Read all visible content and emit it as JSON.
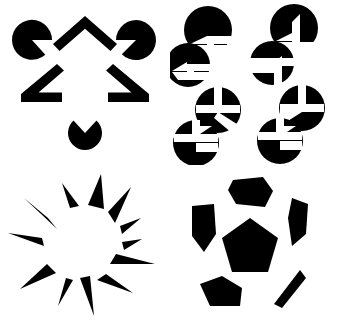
{
  "figure": {
    "background_color": "#ffffff",
    "ink_color": "#000000",
    "width": 337,
    "height": 323,
    "panel_count": 4
  },
  "panels": [
    {
      "id": "kanizsa-triangle",
      "label": "Kanizsa Triangle",
      "position": "top-left",
      "inducer_count": 7,
      "illusory_shape": "triangle",
      "inducers": [
        {
          "name": "pacman-top-left",
          "type": "pacman",
          "cx": 32,
          "cy": 40,
          "r": 20,
          "notch_deg": 75,
          "opening_deg": 40,
          "label": "notched disk opening lower-right"
        },
        {
          "name": "pacman-top-right",
          "type": "pacman",
          "cx": 136,
          "cy": 40,
          "r": 20,
          "notch_deg": 65,
          "opening_deg": 140,
          "label": "notched disk opening lower-left"
        },
        {
          "name": "pacman-bottom",
          "type": "pacman",
          "cx": 85,
          "cy": 133,
          "r": 17,
          "notch_deg": 60,
          "opening_deg": 270,
          "label": "notched disk opening upward"
        },
        {
          "name": "chevron-top",
          "type": "angle",
          "label": "open angle pointing up"
        },
        {
          "name": "angle-bottom-left",
          "type": "angle",
          "label": "open angle opening right"
        },
        {
          "name": "angle-bottom-right",
          "type": "angle",
          "label": "open angle opening left"
        }
      ]
    },
    {
      "id": "illusory-cubes",
      "label": "Illusory Cubes Array",
      "position": "top-right",
      "inducer_count": 8,
      "illusory_shape": "cubes",
      "grid_rows": 2,
      "grid_cols": 2,
      "discs": [
        {
          "name": "disc-1",
          "cx": 38,
          "cy": 30,
          "r": 24
        },
        {
          "name": "disc-2",
          "cx": 124,
          "cy": 28,
          "r": 24
        },
        {
          "name": "disc-3",
          "cx": 18,
          "cy": 65,
          "r": 22
        },
        {
          "name": "disc-4",
          "cx": 102,
          "cy": 63,
          "r": 22
        },
        {
          "name": "disc-5",
          "cx": 48,
          "cy": 110,
          "r": 23
        },
        {
          "name": "disc-6",
          "cx": 132,
          "cy": 108,
          "r": 23
        },
        {
          "name": "disc-7",
          "cx": 26,
          "cy": 143,
          "r": 23
        },
        {
          "name": "disc-8",
          "cx": 110,
          "cy": 141,
          "r": 23
        }
      ]
    },
    {
      "id": "radial-spikes",
      "label": "Illusory Circle from Radial Spikes",
      "position": "bottom-left",
      "illusory_shape": "circle",
      "spike_count": 13,
      "center_x": 85,
      "center_y": 85,
      "inner_radius": 38
    },
    {
      "id": "soccer-ball",
      "label": "Illusory Sphere (Soccer Ball)",
      "position": "bottom-right",
      "illusory_shape": "sphere",
      "patch_count": 7,
      "center_x": 80,
      "center_y": 80
    }
  ]
}
